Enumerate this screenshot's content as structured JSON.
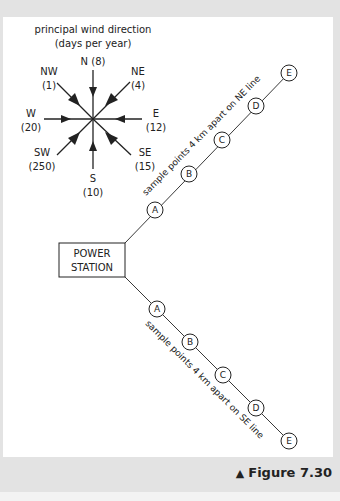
{
  "figure": {
    "caption_marker": "▲",
    "caption": "Figure 7.30"
  },
  "wind_rose": {
    "title": "principal wind direction",
    "subtitle": "(days per year)",
    "directions": [
      {
        "dir": "N",
        "label": "N (8)",
        "days": 8
      },
      {
        "dir": "NE",
        "label": "NE",
        "value_label": "(4)",
        "days": 4
      },
      {
        "dir": "E",
        "label": "E",
        "value_label": "(12)",
        "days": 12
      },
      {
        "dir": "SE",
        "label": "SE",
        "value_label": "(15)",
        "days": 15
      },
      {
        "dir": "S",
        "label": "S",
        "value_label": "(10)",
        "days": 10
      },
      {
        "dir": "SW",
        "label": "SW",
        "value_label": "(250)",
        "days": 250
      },
      {
        "dir": "W",
        "label": "W",
        "value_label": "(20)",
        "days": 20
      },
      {
        "dir": "NW",
        "label": "NW",
        "value_label": "(1)",
        "days": 1
      }
    ]
  },
  "power_station": {
    "line1": "POWER",
    "line2": "STATION"
  },
  "ne_line": {
    "label": "sample points 4 km apart on NE line",
    "points": [
      "A",
      "B",
      "C",
      "D",
      "E"
    ]
  },
  "se_line": {
    "label": "sample points 4 km apart on SE line",
    "points": [
      "A",
      "B",
      "C",
      "D",
      "E"
    ]
  },
  "colors": {
    "ink": "#222222",
    "panel": "#ffffff",
    "frame": "#e3e3e3"
  }
}
